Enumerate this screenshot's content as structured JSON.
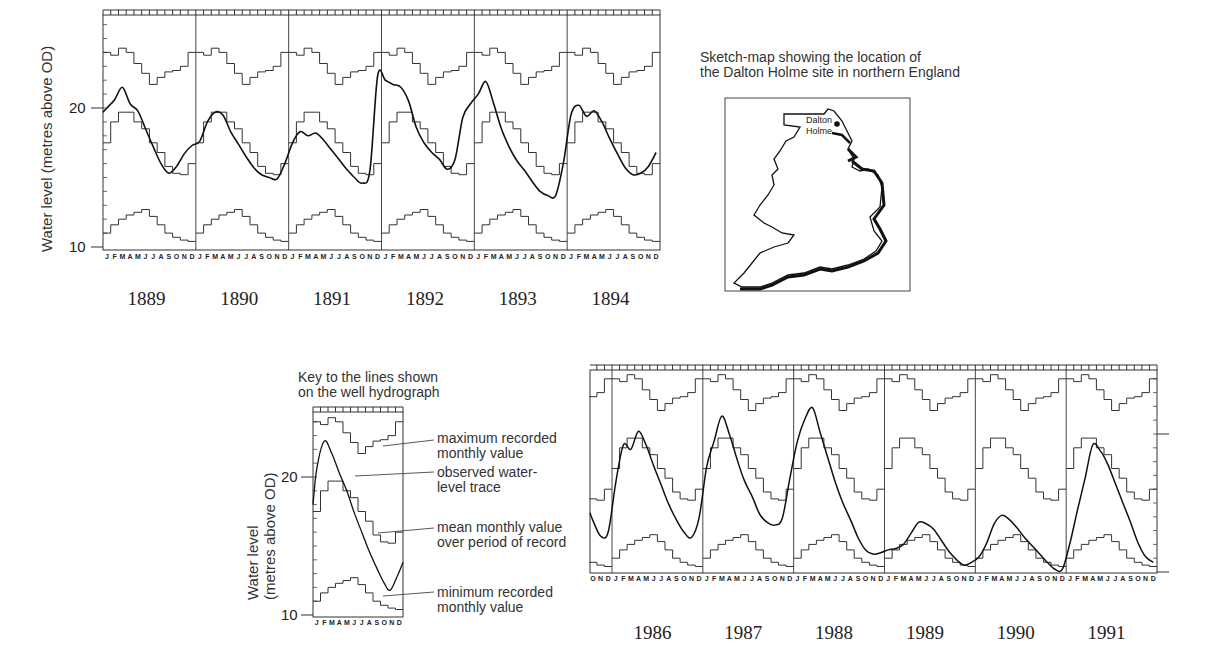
{
  "top_chart": {
    "ylabel": "Water level (metres above OD)",
    "yticks": [
      "20",
      "10"
    ],
    "years": [
      "1889",
      "1890",
      "1891",
      "1892",
      "1893",
      "1894"
    ],
    "month_letters": [
      "J",
      "F",
      "M",
      "A",
      "M",
      "J",
      "J",
      "A",
      "S",
      "O",
      "N",
      "D"
    ]
  },
  "map": {
    "caption_line1": "Sketch-map showing the location of",
    "caption_line2": "the Dalton Holme site in northern England",
    "site_label_line1": "Dalton",
    "site_label_line2": "Holme"
  },
  "key": {
    "title_line1": "Key to the lines shown",
    "title_line2": "on the well hydrograph",
    "ylabel_line1": "Water level",
    "ylabel_line2": "(metres above OD)",
    "yticks": [
      "20",
      "10"
    ],
    "labels": [
      {
        "line1": "maximum recorded",
        "line2": "monthly value"
      },
      {
        "line1": "observed water-",
        "line2": "level trace"
      },
      {
        "line1": "mean monthly value",
        "line2": "over period of record"
      },
      {
        "line1": "minimum recorded",
        "line2": "monthly value"
      }
    ]
  },
  "bottom_chart": {
    "years": [
      "1986",
      "1987",
      "1988",
      "1989",
      "1990",
      "1991"
    ],
    "lead_months": [
      "O",
      "N",
      "D"
    ]
  },
  "chart_data": [
    {
      "type": "line",
      "title": "Dalton Holme well hydrograph 1889-1894",
      "xlabel": "Month / Year",
      "ylabel": "Water level (metres above OD)",
      "ylim": [
        10,
        26.7
      ],
      "categories": [
        "J",
        "F",
        "M",
        "A",
        "M",
        "J",
        "J",
        "A",
        "S",
        "O",
        "N",
        "D"
      ],
      "x_years": [
        "1889",
        "1890",
        "1891",
        "1892",
        "1893",
        "1894"
      ],
      "series": [
        {
          "name": "maximum recorded monthly value (repeats each year)",
          "values": [
            24,
            23.8,
            24.3,
            24,
            23.2,
            22.5,
            21.7,
            22.2,
            22.6,
            22.7,
            23,
            24
          ]
        },
        {
          "name": "mean monthly value over period of record (repeats each year)",
          "values": [
            17.5,
            19,
            19.7,
            19.7,
            19,
            18.5,
            17.5,
            16.8,
            15.8,
            15.3,
            15.2,
            16
          ]
        },
        {
          "name": "minimum recorded monthly value (repeats each year)",
          "values": [
            11,
            11.6,
            12,
            12.3,
            12.5,
            12.7,
            12.2,
            11.6,
            11,
            10.7,
            10.5,
            10.4
          ]
        },
        {
          "name": "observed water-level trace",
          "values": [
            20,
            20.6,
            21.5,
            20.3,
            19.8,
            18.5,
            17.2,
            16,
            15.3,
            15.8,
            16.7,
            17.3,
            17.6,
            19,
            19.7,
            19.5,
            18.3,
            17.4,
            16.5,
            15.7,
            15.2,
            15,
            14.9,
            16,
            17.5,
            18.3,
            18,
            18.2,
            17.7,
            17,
            16.3,
            15.6,
            15,
            14.6,
            15.5,
            22.3,
            22,
            21.7,
            21.5,
            20.5,
            18.6,
            17.5,
            16.8,
            16.3,
            15.6,
            16.3,
            19.3,
            20.3,
            21,
            21.9,
            20.3,
            18.5,
            17.2,
            16.2,
            15.5,
            14.7,
            14,
            13.7,
            13.7,
            16,
            19.5,
            20.2,
            19.4,
            19.8,
            19,
            17.8,
            16.7,
            15.7,
            15.2,
            15.3,
            15.8,
            16.8
          ]
        }
      ],
      "annotations": [
        "Sketch-map showing the location of the Dalton Holme site in northern England"
      ]
    },
    {
      "type": "line",
      "title": "Dalton Holme well hydrograph 1986-1991",
      "xlabel": "Month / Year",
      "ylabel": "Water level (metres above OD)",
      "ylim": [
        10,
        24.6
      ],
      "categories": [
        "O",
        "N",
        "D",
        "J",
        "F",
        "M",
        "A",
        "M",
        "J",
        "J",
        "A",
        "S",
        "O",
        "N",
        "D"
      ],
      "x_years": [
        "1986",
        "1987",
        "1988",
        "1989",
        "1990",
        "1991"
      ],
      "series": [
        {
          "name": "maximum recorded monthly value (repeats each year)",
          "values": [
            24,
            23.8,
            24.3,
            24,
            23.2,
            22.5,
            21.7,
            22.2,
            22.6,
            22.7,
            23,
            24
          ]
        },
        {
          "name": "mean monthly value over period of record (repeats each year)",
          "values": [
            17.5,
            19,
            19.7,
            19.7,
            19,
            18.5,
            17.5,
            16.8,
            15.8,
            15.3,
            15.2,
            16
          ]
        },
        {
          "name": "minimum recorded monthly value (repeats each year)",
          "values": [
            11,
            11.6,
            12,
            12.3,
            12.5,
            12.7,
            12.2,
            11.6,
            11,
            10.7,
            10.5,
            10.4
          ]
        },
        {
          "name": "observed water-level trace (Oct 1985 - Dec 1991)",
          "values": [
            13.7,
            12.6,
            12.9,
            16.5,
            19.2,
            18.9,
            20.2,
            19.2,
            17.7,
            16.3,
            14.9,
            13.8,
            12.9,
            12.5,
            13.9,
            17.6,
            19.5,
            21.3,
            20,
            18.2,
            16.6,
            15.5,
            14.2,
            13.6,
            13.4,
            13.9,
            16.8,
            19.5,
            21.1,
            21.9,
            20.1,
            18.3,
            16.5,
            15,
            13.8,
            12.5,
            11.6,
            11.3,
            11.4,
            11.6,
            11.7,
            12,
            12.8,
            13.6,
            13.5,
            13.1,
            12.3,
            11.5,
            10.9,
            10.5,
            10.7,
            11.1,
            12.1,
            13.5,
            14.1,
            13.8,
            13.2,
            12.5,
            11.9,
            11.3,
            10.7,
            10.2,
            10.2,
            12.1,
            14.5,
            16.8,
            19.2,
            18.8,
            17.8,
            16.4,
            15,
            13.6,
            12.1,
            11.1,
            10.7
          ]
        }
      ]
    }
  ]
}
